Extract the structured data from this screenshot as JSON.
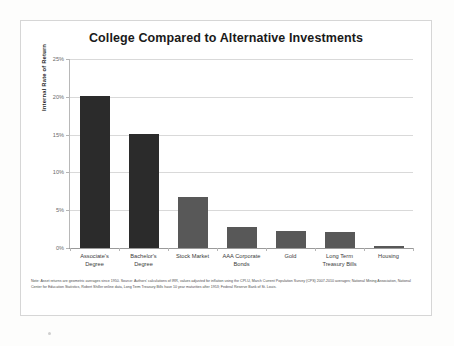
{
  "figure": {
    "title": "College Compared to Alternative Investments",
    "footnote": "Note: Asset returns are geometric averages since 1950. Source: Authors' calculations of IRR, values adjusted for inflation using the CPI-U, March Current Population Survey (CPS) 2007-2010 averages; National Mining Association, National Center for Education Statistics, Robert Shiller online data, Long Term Treasury Bills have 10 year maturities after 1953; Federal Reserve Bank of St. Louis."
  },
  "colors": {
    "bar_dark": "#2b2b2b",
    "bar_gray": "#585858",
    "gridline": "#d9d9d9",
    "axis": "#b8b8b8",
    "border": "#d6d6d6",
    "title_text": "#1a1a1a"
  },
  "chart_data": {
    "type": "bar",
    "title": "College Compared to Alternative Investments",
    "xlabel": "",
    "ylabel": "Internal Rate of Return",
    "ylim": [
      0,
      25
    ],
    "yticks": [
      0,
      5,
      10,
      15,
      20,
      25
    ],
    "ytick_labels": [
      "0%",
      "5%",
      "10%",
      "15%",
      "20%",
      "25%"
    ],
    "grid": true,
    "legend": false,
    "categories": [
      "Associate's Degree",
      "Bachelor's Degree",
      "Stock Market",
      "AAA Corporate Bonds",
      "Gold",
      "Long Term Treasury Bills",
      "Housing"
    ],
    "category_lines": [
      [
        "Associate's",
        "Degree"
      ],
      [
        "Bachelor's",
        "Degree"
      ],
      [
        "Stock Market"
      ],
      [
        "AAA Corporate",
        "Bonds"
      ],
      [
        "Gold"
      ],
      [
        "Long Term",
        "Treasury Bills"
      ],
      [
        "Housing"
      ]
    ],
    "values": [
      20.1,
      15.1,
      6.8,
      2.8,
      2.2,
      2.1,
      0.3
    ],
    "bar_colors": [
      "#2b2b2b",
      "#2b2b2b",
      "#585858",
      "#585858",
      "#585858",
      "#585858",
      "#585858"
    ]
  }
}
